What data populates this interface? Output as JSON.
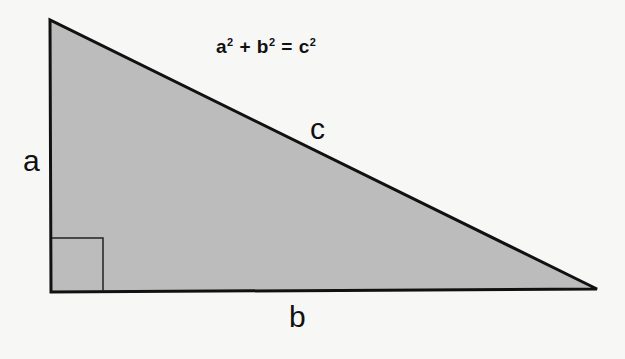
{
  "diagram": {
    "title_formula": {
      "a": "a",
      "b": "b",
      "c": "c",
      "exp": "2",
      "plus": " + ",
      "equals": " = "
    },
    "labels": {
      "a": "a",
      "b": "b",
      "c": "c"
    },
    "colors": {
      "fill": "#bcbcbc",
      "stroke": "#111111",
      "background": "#f7f7f6"
    },
    "triangle": {
      "vertices": [
        [
          50,
          20
        ],
        [
          51,
          292
        ],
        [
          597,
          289
        ]
      ],
      "right_angle_marker": [
        51,
        238,
        52
      ]
    }
  }
}
